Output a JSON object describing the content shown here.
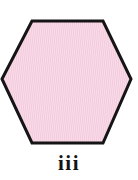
{
  "figure": {
    "caption": "iii",
    "shape": {
      "name": "hexagon",
      "sides": 6,
      "orientation": "flat-top",
      "fill_color": "#f9dde9",
      "fill_pattern": "fine-vertical-hatch",
      "pattern_color": "#f3cadd",
      "stroke_color": "#151515",
      "stroke_width": 3,
      "vertices": [
        [
          2,
          79
        ],
        [
          32,
          21
        ],
        [
          103,
          21
        ],
        [
          131,
          79
        ],
        [
          103,
          143
        ],
        [
          32,
          143
        ]
      ]
    },
    "background_color": "#ffffff"
  }
}
